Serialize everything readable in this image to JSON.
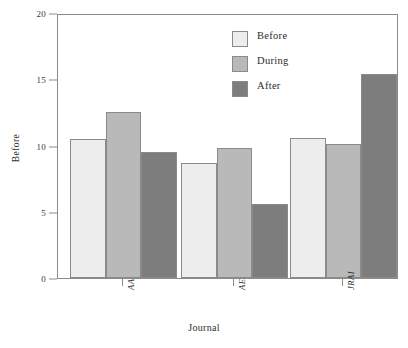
{
  "chart_data": {
    "type": "bar",
    "title": "",
    "subtitle": "",
    "xlabel": "Journal",
    "ylabel": "Before",
    "categories": [
      "AA",
      "AE",
      "JRAI"
    ],
    "series": [
      {
        "name": "Before",
        "values": [
          10.5,
          8.7,
          10.6
        ],
        "color": "#ededed"
      },
      {
        "name": "During",
        "values": [
          12.5,
          9.8,
          10.1
        ],
        "color": "#b9b9b9"
      },
      {
        "name": "After",
        "values": [
          9.5,
          5.6,
          15.4
        ],
        "color": "#7d7d7d"
      }
    ],
    "ylim": [
      0,
      20
    ],
    "yticks": [
      0,
      5,
      10,
      15,
      20
    ],
    "ytick_labels": [
      "0",
      "5",
      "10",
      "15",
      "20"
    ],
    "grid": false,
    "legend_position": "top-center",
    "frame": true,
    "bar_border_color": "#8a8a8a",
    "axis_color": "#8b8b8b"
  },
  "axis": {
    "y_title": "Before",
    "x_title": "Journal",
    "y_ticks": [
      {
        "label": "20",
        "value": 20
      },
      {
        "label": "15",
        "value": 15
      },
      {
        "label": "10",
        "value": 10
      },
      {
        "label": "5",
        "value": 5
      },
      {
        "label": "0",
        "value": 0
      }
    ],
    "x_ticks": [
      {
        "label": "AA"
      },
      {
        "label": "AE"
      },
      {
        "label": "JRAI"
      }
    ]
  },
  "legend": {
    "entries": [
      {
        "label": "Before",
        "color": "#ededed"
      },
      {
        "label": "During",
        "color": "#b9b9b9"
      },
      {
        "label": "After",
        "color": "#7d7d7d"
      }
    ]
  }
}
